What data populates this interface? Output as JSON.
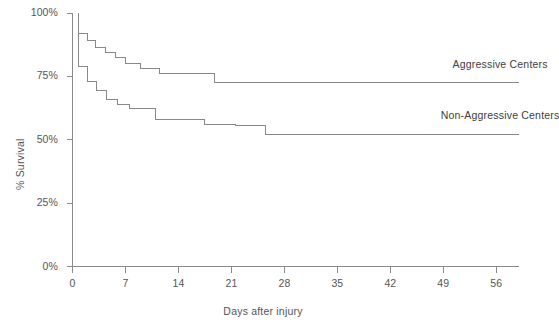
{
  "chart_data": {
    "type": "line",
    "subtype": "kaplan-meier-step",
    "title": "",
    "xlabel": "Days  after injury",
    "ylabel": "% Survival",
    "xlim": [
      0,
      59
    ],
    "ylim": [
      0,
      100
    ],
    "grid": false,
    "legend_position": "inline-right",
    "x_ticks": [
      0,
      7,
      14,
      21,
      28,
      35,
      42,
      49,
      56
    ],
    "x_tick_labels": [
      "0",
      "7",
      "14",
      "21",
      "28",
      "35",
      "42",
      "49",
      "56"
    ],
    "y_ticks": [
      0,
      25,
      50,
      75,
      100
    ],
    "y_tick_labels": [
      "0%",
      "25%",
      "50%",
      "75%",
      "100%"
    ],
    "line_color": "#888888",
    "axis_color": "#8a8a8a",
    "series": [
      {
        "name": "Aggressive Centers",
        "label_x": 56.5,
        "label_y": 79.5,
        "steps": [
          [
            0.8,
            100
          ],
          [
            0.8,
            92
          ],
          [
            2.0,
            92
          ],
          [
            2.0,
            89
          ],
          [
            3.0,
            89
          ],
          [
            3.0,
            86.5
          ],
          [
            4.3,
            86.5
          ],
          [
            4.3,
            84.5
          ],
          [
            5.7,
            84.5
          ],
          [
            5.7,
            82.5
          ],
          [
            7.0,
            82.5
          ],
          [
            7.0,
            80
          ],
          [
            9.0,
            80
          ],
          [
            9.0,
            78
          ],
          [
            11.5,
            78
          ],
          [
            11.5,
            76
          ],
          [
            18.7,
            76
          ],
          [
            18.7,
            72.5
          ],
          [
            59,
            72.5
          ]
        ]
      },
      {
        "name": "Non-Aggressive Centers",
        "label_x": 56.5,
        "label_y": 59.5,
        "steps": [
          [
            0.8,
            100
          ],
          [
            0.8,
            79
          ],
          [
            2.0,
            79
          ],
          [
            2.0,
            73
          ],
          [
            3.2,
            73
          ],
          [
            3.2,
            69.5
          ],
          [
            4.5,
            69.5
          ],
          [
            4.5,
            66
          ],
          [
            6.0,
            66
          ],
          [
            6.0,
            64
          ],
          [
            7.5,
            64
          ],
          [
            7.5,
            62.5
          ],
          [
            11.0,
            62.5
          ],
          [
            11.0,
            58
          ],
          [
            17.5,
            58
          ],
          [
            17.5,
            56
          ],
          [
            21.5,
            56
          ],
          [
            21.5,
            55.5
          ],
          [
            25.5,
            55.5
          ],
          [
            25.5,
            52
          ],
          [
            59,
            52
          ]
        ]
      }
    ]
  },
  "axes": {
    "y_title": "% Survival",
    "x_title": "Days  after injury"
  },
  "labels": {
    "series_1": "Aggressive Centers",
    "series_2": "Non-Aggressive Centers"
  }
}
